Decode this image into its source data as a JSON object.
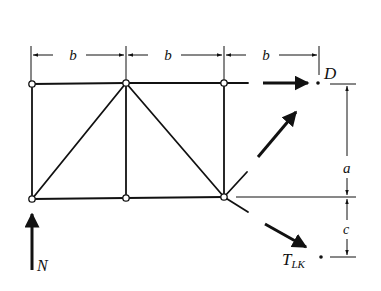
{
  "diagram": {
    "type": "truss-free-body-diagram",
    "dimensions": {
      "top_spans": [
        "b",
        "b",
        "b"
      ],
      "vertical_upper": "a",
      "vertical_lower": "c"
    },
    "points": {
      "moment_point": "D"
    },
    "forces": {
      "reaction": "N",
      "member_force_main": "T",
      "member_force_sub": "LK"
    },
    "colors": {
      "ink": "#111111",
      "background": "#ffffff"
    }
  }
}
